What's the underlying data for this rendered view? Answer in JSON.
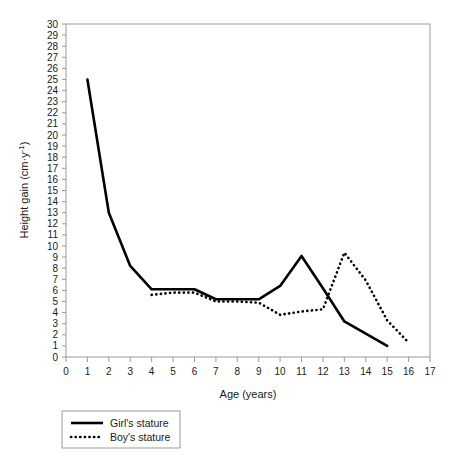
{
  "chart_data": {
    "type": "line",
    "title": "",
    "xlabel": "Age (years)",
    "ylabel": "Height gain (cm·y⁻¹)",
    "xlim": [
      0,
      17
    ],
    "ylim": [
      0,
      30
    ],
    "xticks": [
      "0",
      "1",
      "2",
      "3",
      "4",
      "5",
      "6",
      "7",
      "8",
      "9",
      "10",
      "11",
      "12",
      "13",
      "14",
      "15",
      "16",
      "17"
    ],
    "yticks": [
      "0",
      "1",
      "2",
      "3",
      "4",
      "5",
      "6",
      "7",
      "8",
      "9",
      "10",
      "11",
      "12",
      "13",
      "14",
      "15",
      "16",
      "17",
      "18",
      "19",
      "20",
      "21",
      "22",
      "23",
      "24",
      "25",
      "26",
      "27",
      "28",
      "29",
      "30"
    ],
    "grid": false,
    "legend_position": "below-axes-left",
    "series": [
      {
        "name": "Girl's stature",
        "style": "solid",
        "color": "#000000",
        "x": [
          1,
          2,
          3,
          4,
          5,
          6,
          7,
          8,
          9,
          10,
          11,
          12,
          13,
          14,
          15
        ],
        "values": [
          25,
          13,
          8.2,
          6.1,
          6.1,
          6.1,
          5.2,
          5.2,
          5.2,
          6.4,
          9.1,
          6.2,
          3.2,
          2.1,
          1.0
        ]
      },
      {
        "name": "Boy's stature",
        "style": "dotted",
        "color": "#000000",
        "x": [
          4,
          5,
          6,
          7,
          8,
          9,
          10,
          11,
          12,
          13,
          14,
          15,
          16
        ],
        "values": [
          5.6,
          5.8,
          5.8,
          5.0,
          5.0,
          4.9,
          3.8,
          4.1,
          4.3,
          9.4,
          6.9,
          3.3,
          1.3
        ]
      }
    ]
  },
  "axes": {
    "x_title": "Age (years)",
    "y_title_prefix": "Height gain (cm·y",
    "y_title_exponent": "-1",
    "y_title_suffix": ")"
  },
  "legend": {
    "entries": [
      {
        "label": "Girl's stature",
        "marker": "solid-line-swatch"
      },
      {
        "label": "Boy's stature",
        "marker": "dotted-line-swatch"
      }
    ]
  },
  "colors": {
    "series": "#000000",
    "frame": "#9a9a9a",
    "background": "#ffffff",
    "text": "#1a1a1a"
  }
}
